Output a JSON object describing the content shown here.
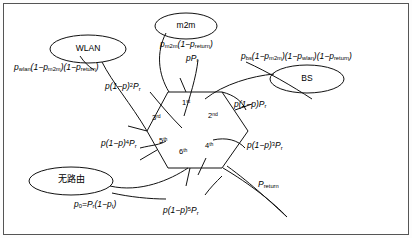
{
  "figure": {
    "type": "state-transition-diagram",
    "background": "#ffffff",
    "border_color": "#555555",
    "line_color": "#111111"
  },
  "nodes": [
    {
      "id": "m2m",
      "label": "m2m",
      "script": "latin",
      "cx": 186,
      "cy": 26,
      "rx": 31,
      "ry": 13
    },
    {
      "id": "wlan",
      "label": "WLAN",
      "script": "latin",
      "cx": 88,
      "cy": 49,
      "rx": 38,
      "ry": 14
    },
    {
      "id": "bs",
      "label": "BS",
      "script": "latin",
      "cx": 307,
      "cy": 79,
      "rx": 37,
      "ry": 14
    },
    {
      "id": "noroute",
      "label": "无路由",
      "script": "cjk",
      "cx": 71,
      "cy": 181,
      "rx": 42,
      "ry": 14
    }
  ],
  "edge_labels": [
    {
      "id": "p-wlan",
      "text": "p_wlan(1-p_m2m)(1-p_return)",
      "x": 14,
      "y": 63
    },
    {
      "id": "p-m2m",
      "text": "p_m2m(1-p_return)",
      "x": 160,
      "y": 40
    },
    {
      "id": "p-pr",
      "text": "pP_r",
      "x": 186,
      "y": 54
    },
    {
      "id": "p-bs",
      "text": "p_bs(1-p_m2m)(1-p_wlan)(1-p_return)",
      "x": 241,
      "y": 52
    },
    {
      "id": "p-2",
      "text": "p(1-p)^2 P_r",
      "x": 105,
      "y": 82
    },
    {
      "id": "p-1",
      "text": "p(1-p)P_r",
      "x": 234,
      "y": 100
    },
    {
      "id": "p-3",
      "text": "p(1-p)^3 P_r",
      "x": 247,
      "y": 141
    },
    {
      "id": "p-4",
      "text": "p(1-p)^4 P_r",
      "x": 101,
      "y": 139
    },
    {
      "id": "p-5",
      "text": "p(1-p)^5 P_r",
      "x": 163,
      "y": 206
    },
    {
      "id": "p-0",
      "text": "p_0 = P_r(1-p_t)",
      "x": 74,
      "y": 200
    },
    {
      "id": "p-return",
      "text": "p_return",
      "x": 258,
      "y": 180
    }
  ],
  "ordinals": [
    {
      "id": "ord-1",
      "text": "1",
      "suffix": "st",
      "x": 186,
      "y": 103
    },
    {
      "id": "ord-2",
      "text": "2",
      "suffix": "nd",
      "x": 213,
      "y": 116
    },
    {
      "id": "ord-3",
      "text": "3",
      "suffix": "rd",
      "x": 157,
      "y": 118
    },
    {
      "id": "ord-4",
      "text": "4",
      "suffix": "th",
      "x": 210,
      "y": 146
    },
    {
      "id": "ord-5",
      "text": "5",
      "suffix": "th",
      "x": 164,
      "y": 141
    },
    {
      "id": "ord-6",
      "text": "6",
      "suffix": "th",
      "x": 184,
      "y": 152
    }
  ],
  "hexagon": {
    "points": "168,92 222,92 248,131 222,168 168,168 147,131"
  }
}
